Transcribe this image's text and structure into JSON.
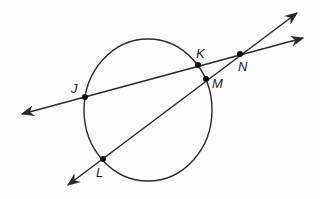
{
  "diagram": {
    "type": "circle-with-secant-lines",
    "colors": {
      "stroke": "#2a2a2a",
      "point": "#111111",
      "background": "#fdfdfd"
    },
    "circle": {
      "cx": 148,
      "cy": 110,
      "rx": 64,
      "ry": 71
    },
    "points": [
      {
        "id": "J",
        "label": "J",
        "x": 85,
        "y": 97,
        "label_x": 71,
        "label_y": 93
      },
      {
        "id": "K",
        "label": "K",
        "x": 198,
        "y": 65,
        "label_x": 196,
        "label_y": 58
      },
      {
        "id": "N",
        "label": "N",
        "x": 240,
        "y": 54,
        "label_x": 238,
        "label_y": 71
      },
      {
        "id": "M",
        "label": "M",
        "x": 206,
        "y": 79,
        "label_x": 212,
        "label_y": 88
      },
      {
        "id": "L",
        "label": "L",
        "x": 103,
        "y": 159,
        "label_x": 96,
        "label_y": 177
      }
    ],
    "lines": [
      {
        "id": "line-JKN",
        "through": [
          "J",
          "K",
          "N"
        ],
        "x1": 22,
        "y1": 114,
        "x2": 303,
        "y2": 38
      },
      {
        "id": "line-LMN",
        "through": [
          "L",
          "M",
          "N"
        ],
        "x1": 68,
        "y1": 185,
        "x2": 297,
        "y2": 13
      }
    ]
  }
}
